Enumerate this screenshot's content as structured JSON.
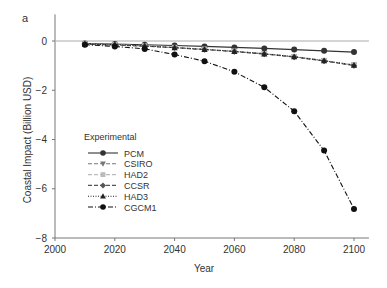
{
  "panel_label": "a",
  "chart_data": {
    "type": "line",
    "title": "",
    "xlabel": "Year",
    "ylabel": "Coastal Impact (Billion USD)",
    "xlim": [
      2000,
      2105
    ],
    "ylim": [
      -8,
      1
    ],
    "xticks": [
      2000,
      2020,
      2040,
      2060,
      2080,
      2100
    ],
    "yticks": [
      0,
      -2,
      -4,
      -6,
      -8
    ],
    "grid": false,
    "reference_line_y": 0,
    "legend": {
      "title": "Experimental",
      "position": "lower left"
    },
    "x": [
      2010,
      2020,
      2030,
      2040,
      2050,
      2060,
      2070,
      2080,
      2090,
      2100
    ],
    "series": [
      {
        "name": "PCM",
        "style": "solid",
        "marker": "circle",
        "color": "#333333",
        "values": [
          -0.1,
          -0.12,
          -0.15,
          -0.18,
          -0.22,
          -0.26,
          -0.3,
          -0.35,
          -0.4,
          -0.45
        ]
      },
      {
        "name": "CSIRO",
        "style": "dashed",
        "marker": "triangle-down",
        "color": "#777777",
        "values": [
          -0.12,
          -0.15,
          -0.2,
          -0.27,
          -0.34,
          -0.42,
          -0.52,
          -0.64,
          -0.8,
          -0.98
        ]
      },
      {
        "name": "HAD2",
        "style": "dashed",
        "marker": "square",
        "color": "#bbbbbb",
        "values": [
          -0.12,
          -0.15,
          -0.2,
          -0.26,
          -0.33,
          -0.41,
          -0.51,
          -0.63,
          -0.79,
          -0.97
        ]
      },
      {
        "name": "CCSR",
        "style": "dashed",
        "marker": "diamond",
        "color": "#555555",
        "values": [
          -0.13,
          -0.16,
          -0.21,
          -0.27,
          -0.35,
          -0.43,
          -0.53,
          -0.65,
          -0.81,
          -1.0
        ]
      },
      {
        "name": "HAD3",
        "style": "dotted",
        "marker": "triangle-up",
        "color": "#222222",
        "values": [
          -0.12,
          -0.15,
          -0.2,
          -0.27,
          -0.34,
          -0.42,
          -0.52,
          -0.64,
          -0.8,
          -0.98
        ]
      },
      {
        "name": "CGCM1",
        "style": "dashdot",
        "marker": "circle",
        "color": "#111111",
        "values": [
          -0.15,
          -0.22,
          -0.32,
          -0.55,
          -0.82,
          -1.25,
          -1.88,
          -2.85,
          -4.45,
          -6.82
        ]
      }
    ]
  }
}
